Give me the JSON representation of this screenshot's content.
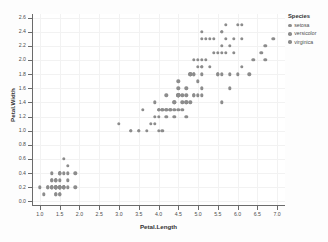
{
  "chart_data": {
    "type": "scatter",
    "title": "",
    "xlabel": "Petal.Length",
    "ylabel": "Petal.Width",
    "xlim": [
      0.8,
      7.2
    ],
    "ylim": [
      -0.05,
      2.65
    ],
    "grid": true,
    "legend_position": "right",
    "legend_title": "Species",
    "x_ticks": [
      "1.0",
      "1.5",
      "2.0",
      "2.5",
      "3.0",
      "3.5",
      "4.0",
      "4.5",
      "5.0",
      "5.5",
      "6.0",
      "6.5",
      "7.0"
    ],
    "x_tick_values": [
      1.0,
      1.5,
      2.0,
      2.5,
      3.0,
      3.5,
      4.0,
      4.5,
      5.0,
      5.5,
      6.0,
      6.5,
      7.0
    ],
    "y_ticks": [
      "0.0",
      "0.2",
      "0.4",
      "0.6",
      "0.8",
      "1.0",
      "1.2",
      "1.4",
      "1.6",
      "1.8",
      "2.0",
      "2.2",
      "2.4",
      "2.6"
    ],
    "y_tick_values": [
      0.0,
      0.2,
      0.4,
      0.6,
      0.8,
      1.0,
      1.2,
      1.4,
      1.6,
      1.8,
      2.0,
      2.2,
      2.4,
      2.6
    ],
    "point_color": "#8c8c8c",
    "series": [
      {
        "name": "setosa",
        "color": "#8c8c8c",
        "points": [
          [
            1.4,
            0.2
          ],
          [
            1.4,
            0.2
          ],
          [
            1.3,
            0.2
          ],
          [
            1.5,
            0.2
          ],
          [
            1.4,
            0.2
          ],
          [
            1.7,
            0.4
          ],
          [
            1.4,
            0.3
          ],
          [
            1.5,
            0.2
          ],
          [
            1.4,
            0.2
          ],
          [
            1.5,
            0.1
          ],
          [
            1.5,
            0.2
          ],
          [
            1.6,
            0.2
          ],
          [
            1.4,
            0.1
          ],
          [
            1.1,
            0.1
          ],
          [
            1.2,
            0.2
          ],
          [
            1.5,
            0.4
          ],
          [
            1.3,
            0.4
          ],
          [
            1.4,
            0.3
          ],
          [
            1.7,
            0.3
          ],
          [
            1.5,
            0.3
          ],
          [
            1.7,
            0.2
          ],
          [
            1.5,
            0.4
          ],
          [
            1.0,
            0.2
          ],
          [
            1.7,
            0.5
          ],
          [
            1.9,
            0.2
          ],
          [
            1.6,
            0.2
          ],
          [
            1.6,
            0.4
          ],
          [
            1.5,
            0.2
          ],
          [
            1.4,
            0.2
          ],
          [
            1.6,
            0.2
          ],
          [
            1.6,
            0.2
          ],
          [
            1.5,
            0.4
          ],
          [
            1.5,
            0.1
          ],
          [
            1.4,
            0.2
          ],
          [
            1.5,
            0.2
          ],
          [
            1.2,
            0.2
          ],
          [
            1.3,
            0.2
          ],
          [
            1.4,
            0.1
          ],
          [
            1.3,
            0.2
          ],
          [
            1.5,
            0.2
          ],
          [
            1.3,
            0.3
          ],
          [
            1.3,
            0.3
          ],
          [
            1.3,
            0.2
          ],
          [
            1.6,
            0.6
          ],
          [
            1.9,
            0.4
          ],
          [
            1.4,
            0.3
          ],
          [
            1.6,
            0.2
          ],
          [
            1.4,
            0.2
          ],
          [
            1.5,
            0.2
          ],
          [
            1.4,
            0.2
          ]
        ]
      },
      {
        "name": "versicolor",
        "color": "#8c8c8c",
        "points": [
          [
            4.7,
            1.4
          ],
          [
            4.5,
            1.5
          ],
          [
            4.9,
            1.5
          ],
          [
            4.0,
            1.3
          ],
          [
            4.6,
            1.5
          ],
          [
            4.5,
            1.3
          ],
          [
            4.7,
            1.6
          ],
          [
            3.3,
            1.0
          ],
          [
            4.6,
            1.3
          ],
          [
            3.9,
            1.4
          ],
          [
            3.5,
            1.0
          ],
          [
            4.2,
            1.5
          ],
          [
            4.0,
            1.0
          ],
          [
            4.7,
            1.4
          ],
          [
            3.6,
            1.3
          ],
          [
            4.4,
            1.4
          ],
          [
            4.5,
            1.5
          ],
          [
            4.1,
            1.0
          ],
          [
            4.5,
            1.5
          ],
          [
            3.9,
            1.1
          ],
          [
            4.8,
            1.8
          ],
          [
            4.0,
            1.3
          ],
          [
            4.9,
            1.5
          ],
          [
            4.7,
            1.2
          ],
          [
            4.3,
            1.3
          ],
          [
            4.4,
            1.4
          ],
          [
            4.8,
            1.4
          ],
          [
            5.0,
            1.7
          ],
          [
            4.5,
            1.5
          ],
          [
            3.5,
            1.0
          ],
          [
            3.8,
            1.1
          ],
          [
            3.7,
            1.0
          ],
          [
            3.9,
            1.2
          ],
          [
            5.1,
            1.6
          ],
          [
            4.5,
            1.5
          ],
          [
            4.5,
            1.6
          ],
          [
            4.7,
            1.5
          ],
          [
            4.4,
            1.3
          ],
          [
            4.1,
            1.3
          ],
          [
            4.0,
            1.3
          ],
          [
            4.4,
            1.2
          ],
          [
            4.6,
            1.4
          ],
          [
            4.0,
            1.2
          ],
          [
            3.3,
            1.0
          ],
          [
            4.2,
            1.3
          ],
          [
            4.2,
            1.2
          ],
          [
            4.2,
            1.3
          ],
          [
            4.3,
            1.3
          ],
          [
            3.0,
            1.1
          ],
          [
            4.1,
            1.3
          ]
        ]
      },
      {
        "name": "virginica",
        "color": "#8c8c8c",
        "points": [
          [
            6.0,
            2.5
          ],
          [
            5.1,
            1.9
          ],
          [
            5.9,
            2.1
          ],
          [
            5.6,
            1.8
          ],
          [
            5.8,
            2.2
          ],
          [
            6.6,
            2.1
          ],
          [
            4.5,
            1.7
          ],
          [
            6.3,
            1.8
          ],
          [
            5.8,
            1.8
          ],
          [
            6.1,
            2.5
          ],
          [
            5.1,
            2.0
          ],
          [
            5.3,
            1.9
          ],
          [
            5.5,
            2.1
          ],
          [
            5.0,
            2.0
          ],
          [
            5.1,
            2.4
          ],
          [
            5.3,
            2.3
          ],
          [
            5.5,
            1.8
          ],
          [
            6.7,
            2.2
          ],
          [
            6.9,
            2.3
          ],
          [
            5.0,
            1.5
          ],
          [
            5.7,
            2.3
          ],
          [
            4.9,
            2.0
          ],
          [
            6.7,
            2.0
          ],
          [
            4.9,
            1.8
          ],
          [
            5.7,
            2.1
          ],
          [
            6.0,
            1.8
          ],
          [
            4.8,
            1.8
          ],
          [
            4.9,
            1.8
          ],
          [
            5.6,
            2.1
          ],
          [
            5.8,
            1.6
          ],
          [
            6.1,
            1.9
          ],
          [
            6.4,
            2.0
          ],
          [
            5.6,
            2.2
          ],
          [
            5.1,
            1.5
          ],
          [
            5.6,
            1.4
          ],
          [
            6.1,
            2.3
          ],
          [
            5.6,
            2.4
          ],
          [
            5.5,
            1.8
          ],
          [
            4.8,
            1.8
          ],
          [
            5.4,
            2.1
          ],
          [
            5.6,
            2.4
          ],
          [
            5.1,
            2.3
          ],
          [
            5.1,
            1.9
          ],
          [
            5.9,
            2.3
          ],
          [
            5.7,
            2.5
          ],
          [
            5.2,
            2.3
          ],
          [
            5.0,
            1.9
          ],
          [
            5.2,
            2.0
          ],
          [
            5.4,
            2.3
          ],
          [
            5.1,
            1.8
          ]
        ]
      }
    ]
  }
}
